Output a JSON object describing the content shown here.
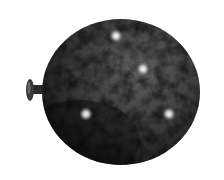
{
  "image": {
    "subject": "balloon",
    "description": "Grayscale inflated balloon with mottled dark texture and four small bright light spots; knot/nozzle on left side",
    "background_color": "#ffffff",
    "balloon": {
      "center_x": 121,
      "center_y": 92,
      "radius_x": 79,
      "radius_y": 73,
      "base_color": "#3a3a3a",
      "dark_color": "#111111",
      "light_color": "#6a6a6a"
    },
    "nozzle": {
      "x": 26,
      "y": 79,
      "width": 18,
      "height": 22
    },
    "highlights": [
      {
        "x": 116,
        "y": 36
      },
      {
        "x": 143,
        "y": 69
      },
      {
        "x": 86,
        "y": 114
      },
      {
        "x": 169,
        "y": 114
      }
    ]
  }
}
